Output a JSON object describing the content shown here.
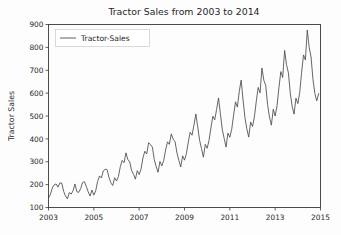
{
  "chart_data": {
    "type": "line",
    "title": "Tractor Sales from 2003 to 2014",
    "xlabel": "",
    "ylabel": "Tractor Sales",
    "xlim": [
      2003.0,
      2015.0
    ],
    "ylim": [
      100,
      900
    ],
    "grid": false,
    "legend_position": "upper left",
    "x_tick_labels": [
      "2003",
      "2005",
      "2007",
      "2009",
      "2011",
      "2013",
      "2015"
    ],
    "x_tick_values": [
      2003,
      2005,
      2007,
      2009,
      2011,
      2013,
      2015
    ],
    "y_tick_labels": [
      "100",
      "200",
      "300",
      "400",
      "500",
      "600",
      "700",
      "800",
      "900"
    ],
    "y_tick_values": [
      100,
      200,
      300,
      400,
      500,
      600,
      700,
      800,
      900
    ],
    "series": [
      {
        "name": "Tractor-Sales",
        "color": "#4a4a4a",
        "x": [
          2003.0,
          2003.083,
          2003.167,
          2003.25,
          2003.333,
          2003.417,
          2003.5,
          2003.583,
          2003.667,
          2003.75,
          2003.833,
          2003.917,
          2004.0,
          2004.083,
          2004.167,
          2004.25,
          2004.333,
          2004.417,
          2004.5,
          2004.583,
          2004.667,
          2004.75,
          2004.833,
          2004.917,
          2005.0,
          2005.083,
          2005.167,
          2005.25,
          2005.333,
          2005.417,
          2005.5,
          2005.583,
          2005.667,
          2005.75,
          2005.833,
          2005.917,
          2006.0,
          2006.083,
          2006.167,
          2006.25,
          2006.333,
          2006.417,
          2006.5,
          2006.583,
          2006.667,
          2006.75,
          2006.833,
          2006.917,
          2007.0,
          2007.083,
          2007.167,
          2007.25,
          2007.333,
          2007.417,
          2007.5,
          2007.583,
          2007.667,
          2007.75,
          2007.833,
          2007.917,
          2008.0,
          2008.083,
          2008.167,
          2008.25,
          2008.333,
          2008.417,
          2008.5,
          2008.583,
          2008.667,
          2008.75,
          2008.833,
          2008.917,
          2009.0,
          2009.083,
          2009.167,
          2009.25,
          2009.333,
          2009.417,
          2009.5,
          2009.583,
          2009.667,
          2009.75,
          2009.833,
          2009.917,
          2010.0,
          2010.083,
          2010.167,
          2010.25,
          2010.333,
          2010.417,
          2010.5,
          2010.583,
          2010.667,
          2010.75,
          2010.833,
          2010.917,
          2011.0,
          2011.083,
          2011.167,
          2011.25,
          2011.333,
          2011.417,
          2011.5,
          2011.583,
          2011.667,
          2011.75,
          2011.833,
          2011.917,
          2012.0,
          2012.083,
          2012.167,
          2012.25,
          2012.333,
          2012.417,
          2012.5,
          2012.583,
          2012.667,
          2012.75,
          2012.833,
          2012.917,
          2013.0,
          2013.083,
          2013.167,
          2013.25,
          2013.333,
          2013.417,
          2013.5,
          2013.583,
          2013.667,
          2013.75,
          2013.833,
          2013.917,
          2014.0,
          2014.083,
          2014.167,
          2014.25,
          2014.333,
          2014.417,
          2014.5,
          2014.583,
          2014.667,
          2014.75,
          2014.833,
          2014.917
        ],
        "values": [
          141,
          157,
          185,
          199,
          203,
          189,
          207,
          207,
          171,
          150,
          138,
          165,
          159,
          173,
          203,
          169,
          166,
          182,
          209,
          213,
          193,
          169,
          150,
          176,
          154,
          173,
          214,
          238,
          229,
          260,
          267,
          266,
          232,
          208,
          196,
          230,
          216,
          235,
          278,
          306,
          296,
          339,
          310,
          299,
          262,
          245,
          224,
          261,
          244,
          268,
          317,
          346,
          334,
          383,
          375,
          364,
          309,
          279,
          254,
          301,
          282,
          306,
          351,
          387,
          376,
          422,
          399,
          388,
          339,
          306,
          277,
          326,
          307,
          335,
          386,
          429,
          416,
          460,
          509,
          453,
          393,
          358,
          320,
          376,
          359,
          394,
          449,
          499,
          483,
          529,
          579,
          510,
          441,
          402,
          364,
          425,
          407,
          442,
          504,
          562,
          539,
          608,
          657,
          570,
          493,
          444,
          408,
          474,
          454,
          496,
          564,
          625,
          601,
          710,
          656,
          634,
          549,
          495,
          460,
          530,
          500,
          545,
          625,
          694,
          668,
          787,
          724,
          689,
          600,
          542,
          508,
          578,
          554,
          602,
          691,
          767,
          745,
          876,
          800,
          758,
          661,
          599,
          566,
          598
        ]
      }
    ]
  },
  "legend": {
    "entries": [
      {
        "label": "Tractor-Sales"
      }
    ]
  },
  "axes": {
    "y_title": "Tractor Sales"
  }
}
